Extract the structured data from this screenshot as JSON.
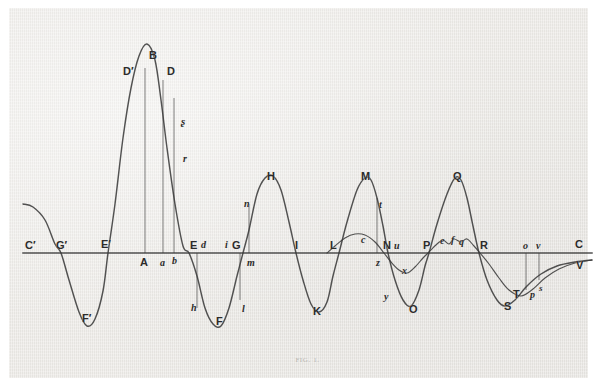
{
  "figure": {
    "caption": "FIG. 1.",
    "paper_color": "#eceae6",
    "ink_color": "#3a3a3a",
    "margin_color": "#ffffff"
  },
  "axis": {
    "baseline_y": 245,
    "x_start": 14,
    "x_end": 583,
    "label_left": "C′",
    "label_right": "C"
  },
  "labels": [
    {
      "id": "C-prime",
      "text": "C′",
      "x": 16,
      "y": 232,
      "style": "cap",
      "size": 11
    },
    {
      "id": "G-prime",
      "text": "G′",
      "x": 47,
      "y": 232,
      "style": "cap",
      "size": 11
    },
    {
      "id": "E-prime",
      "text": "E′",
      "x": 92,
      "y": 231,
      "style": "cap",
      "size": 11
    },
    {
      "id": "F-prime",
      "text": "F′",
      "x": 73,
      "y": 305,
      "style": "cap",
      "size": 11
    },
    {
      "id": "D-prime",
      "text": "D′",
      "x": 114,
      "y": 58,
      "style": "cap",
      "size": 11
    },
    {
      "id": "B",
      "text": "B",
      "x": 140,
      "y": 42,
      "style": "cap",
      "size": 11
    },
    {
      "id": "D",
      "text": "D",
      "x": 158,
      "y": 58,
      "style": "cap",
      "size": 11
    },
    {
      "id": "g-script",
      "text": "ʂ",
      "x": 172,
      "y": 108,
      "style": "ital",
      "size": 11
    },
    {
      "id": "r",
      "text": "r",
      "x": 174,
      "y": 146,
      "style": "ital",
      "size": 10
    },
    {
      "id": "A",
      "text": "A",
      "x": 131,
      "y": 249,
      "style": "cap",
      "size": 11
    },
    {
      "id": "a",
      "text": "a",
      "x": 151,
      "y": 250,
      "style": "ital",
      "size": 10
    },
    {
      "id": "b-axis",
      "text": "b",
      "x": 163,
      "y": 248,
      "style": "ital",
      "size": 10
    },
    {
      "id": "E",
      "text": "E",
      "x": 181,
      "y": 232,
      "style": "cap",
      "size": 11
    },
    {
      "id": "d",
      "text": "d",
      "x": 192,
      "y": 232,
      "style": "ital",
      "size": 10
    },
    {
      "id": "h",
      "text": "h",
      "x": 182,
      "y": 295,
      "style": "ital",
      "size": 10
    },
    {
      "id": "F",
      "text": "F",
      "x": 207,
      "y": 308,
      "style": "cap",
      "size": 11
    },
    {
      "id": "i",
      "text": "i",
      "x": 216,
      "y": 232,
      "style": "ital",
      "size": 10
    },
    {
      "id": "G",
      "text": "G",
      "x": 223,
      "y": 232,
      "style": "cap",
      "size": 11
    },
    {
      "id": "l",
      "text": "l",
      "x": 233,
      "y": 296,
      "style": "ital",
      "size": 10
    },
    {
      "id": "m",
      "text": "m",
      "x": 238,
      "y": 250,
      "style": "ital",
      "size": 10
    },
    {
      "id": "n",
      "text": "n",
      "x": 235,
      "y": 191,
      "style": "ital",
      "size": 10
    },
    {
      "id": "H",
      "text": "H",
      "x": 258,
      "y": 163,
      "style": "cap",
      "size": 11
    },
    {
      "id": "I",
      "text": "I",
      "x": 286,
      "y": 232,
      "style": "cap",
      "size": 11
    },
    {
      "id": "K",
      "text": "K",
      "x": 304,
      "y": 298,
      "style": "cap",
      "size": 11
    },
    {
      "id": "L",
      "text": "L",
      "x": 321,
      "y": 232,
      "style": "cap",
      "size": 11
    },
    {
      "id": "c",
      "text": "c",
      "x": 352,
      "y": 227,
      "style": "ital",
      "size": 10
    },
    {
      "id": "M",
      "text": "M",
      "x": 352,
      "y": 163,
      "style": "cap",
      "size": 11
    },
    {
      "id": "t",
      "text": "t",
      "x": 370,
      "y": 192,
      "style": "ital",
      "size": 10
    },
    {
      "id": "N",
      "text": "N",
      "x": 374,
      "y": 232,
      "style": "cap",
      "size": 11
    },
    {
      "id": "u",
      "text": "u",
      "x": 385,
      "y": 233,
      "style": "ital",
      "size": 10
    },
    {
      "id": "z",
      "text": "z",
      "x": 367,
      "y": 250,
      "style": "ital",
      "size": 10
    },
    {
      "id": "x",
      "text": "x",
      "x": 393,
      "y": 258,
      "style": "ital",
      "size": 10
    },
    {
      "id": "y",
      "text": "y",
      "x": 375,
      "y": 284,
      "style": "ital",
      "size": 10
    },
    {
      "id": "O",
      "text": "O",
      "x": 400,
      "y": 296,
      "style": "cap",
      "size": 11
    },
    {
      "id": "P",
      "text": "P",
      "x": 414,
      "y": 232,
      "style": "cap",
      "size": 11
    },
    {
      "id": "e",
      "text": "e",
      "x": 431,
      "y": 228,
      "style": "ital",
      "size": 10
    },
    {
      "id": "f",
      "text": "f",
      "x": 442,
      "y": 227,
      "style": "ital",
      "size": 10
    },
    {
      "id": "q",
      "text": "q",
      "x": 450,
      "y": 229,
      "style": "ital",
      "size": 10
    },
    {
      "id": "Q",
      "text": "Q",
      "x": 444,
      "y": 163,
      "style": "cap",
      "size": 11
    },
    {
      "id": "R",
      "text": "R",
      "x": 471,
      "y": 232,
      "style": "cap",
      "size": 11
    },
    {
      "id": "S",
      "text": "S",
      "x": 495,
      "y": 293,
      "style": "cap",
      "size": 11
    },
    {
      "id": "T",
      "text": "T",
      "x": 504,
      "y": 281,
      "style": "cap",
      "size": 11
    },
    {
      "id": "p",
      "text": "p",
      "x": 521,
      "y": 282,
      "style": "ital",
      "size": 10
    },
    {
      "id": "s",
      "text": "s",
      "x": 530,
      "y": 276,
      "style": "ital",
      "size": 9
    },
    {
      "id": "o",
      "text": "o",
      "x": 514,
      "y": 233,
      "style": "ital",
      "size": 10
    },
    {
      "id": "v",
      "text": "v",
      "x": 527,
      "y": 233,
      "style": "ital",
      "size": 10
    },
    {
      "id": "C",
      "text": "C",
      "x": 566,
      "y": 231,
      "style": "cap",
      "size": 11
    },
    {
      "id": "V",
      "text": "V",
      "x": 567,
      "y": 252,
      "style": "cap",
      "size": 11
    }
  ],
  "chart_data": {
    "type": "line",
    "title": "FIG. 1.",
    "xlabel": "",
    "ylabel": "",
    "grid": false,
    "legend": null,
    "axis_line_y": 245,
    "series": [
      {
        "name": "main-resonance-curve",
        "note": "Principal curve: enters at left above axis, dips to trough F′, rises through resonance peak B (off-scale tall), falls to trough F, then successive maxima H, M, Q with intervening minima K, O, S, decaying toward V at right.",
        "points": [
          [
            14,
            196
          ],
          [
            24,
            199
          ],
          [
            36,
            212
          ],
          [
            46,
            236
          ],
          [
            52,
            245
          ],
          [
            60,
            272
          ],
          [
            70,
            304
          ],
          [
            78,
            318
          ],
          [
            86,
            311
          ],
          [
            94,
            283
          ],
          [
            99,
            245
          ],
          [
            106,
            196
          ],
          [
            114,
            130
          ],
          [
            122,
            80
          ],
          [
            130,
            48
          ],
          [
            138,
            36
          ],
          [
            146,
            52
          ],
          [
            152,
            92
          ],
          [
            158,
            140
          ],
          [
            166,
            196
          ],
          [
            174,
            238
          ],
          [
            180,
            245
          ],
          [
            188,
            268
          ],
          [
            196,
            300
          ],
          [
            204,
            316
          ],
          [
            212,
            318
          ],
          [
            220,
            300
          ],
          [
            228,
            268
          ],
          [
            234,
            245
          ],
          [
            240,
            222
          ],
          [
            248,
            186
          ],
          [
            256,
            170
          ],
          [
            264,
            168
          ],
          [
            272,
            182
          ],
          [
            280,
            214
          ],
          [
            287,
            245
          ],
          [
            294,
            272
          ],
          [
            302,
            296
          ],
          [
            310,
            304
          ],
          [
            318,
            294
          ],
          [
            324,
            268
          ],
          [
            330,
            245
          ],
          [
            338,
            214
          ],
          [
            348,
            182
          ],
          [
            356,
            170
          ],
          [
            362,
            172
          ],
          [
            368,
            190
          ],
          [
            374,
            218
          ],
          [
            379,
            245
          ],
          [
            386,
            272
          ],
          [
            394,
            292
          ],
          [
            402,
            298
          ],
          [
            410,
            282
          ],
          [
            416,
            258
          ],
          [
            420,
            245
          ],
          [
            428,
            216
          ],
          [
            438,
            186
          ],
          [
            446,
            170
          ],
          [
            452,
            172
          ],
          [
            458,
            190
          ],
          [
            464,
            218
          ],
          [
            470,
            245
          ],
          [
            478,
            272
          ],
          [
            488,
            292
          ],
          [
            496,
            298
          ],
          [
            506,
            292
          ],
          [
            518,
            278
          ],
          [
            532,
            266
          ],
          [
            548,
            258
          ],
          [
            566,
            254
          ],
          [
            583,
            252
          ]
        ]
      },
      {
        "name": "secondary-low-amplitude-curve",
        "note": "Shallow subsidiary curve beginning near L, arching slightly above axis to c, crossing at N/u, dipping below to x, recrossing at P, rippling through e, f, q to R, then falling through T, p, s toward V.",
        "points": [
          [
            318,
            245
          ],
          [
            326,
            238
          ],
          [
            336,
            230
          ],
          [
            346,
            226
          ],
          [
            356,
            227
          ],
          [
            366,
            234
          ],
          [
            375,
            245
          ],
          [
            382,
            254
          ],
          [
            390,
            262
          ],
          [
            398,
            265
          ],
          [
            406,
            259
          ],
          [
            414,
            250
          ],
          [
            419,
            245
          ],
          [
            428,
            236
          ],
          [
            434,
            232
          ],
          [
            440,
            236
          ],
          [
            445,
            231
          ],
          [
            452,
            234
          ],
          [
            458,
            231
          ],
          [
            465,
            238
          ],
          [
            471,
            245
          ],
          [
            480,
            256
          ],
          [
            490,
            270
          ],
          [
            500,
            282
          ],
          [
            512,
            288
          ],
          [
            524,
            281
          ],
          [
            536,
            270
          ],
          [
            550,
            261
          ],
          [
            566,
            255
          ],
          [
            583,
            252
          ]
        ]
      }
    ],
    "ordinate_drop_lines": [
      {
        "id": "A",
        "x": 136,
        "from": 245,
        "to": 60
      },
      {
        "id": "a",
        "x": 154,
        "from": 245,
        "to": 72
      },
      {
        "id": "b",
        "x": 165,
        "from": 245,
        "to": 90
      },
      {
        "id": "h",
        "x": 188,
        "from": 245,
        "to": 300
      },
      {
        "id": "l",
        "x": 231,
        "from": 245,
        "to": 292
      },
      {
        "id": "m",
        "x": 240,
        "from": 245,
        "to": 196
      },
      {
        "id": "t",
        "x": 368,
        "from": 245,
        "to": 190
      },
      {
        "id": "o",
        "x": 517,
        "from": 245,
        "to": 282
      },
      {
        "id": "v",
        "x": 530,
        "from": 245,
        "to": 272
      }
    ],
    "marked_abscissae": [
      "C′",
      "G′",
      "E′",
      "A",
      "a",
      "b",
      "E",
      "d",
      "i",
      "G",
      "I",
      "L",
      "N",
      "u",
      "P",
      "R",
      "o",
      "v",
      "C"
    ],
    "marked_maxima": [
      "B",
      "H",
      "M",
      "Q"
    ],
    "marked_minima": [
      "F′",
      "F",
      "K",
      "O",
      "S"
    ]
  }
}
